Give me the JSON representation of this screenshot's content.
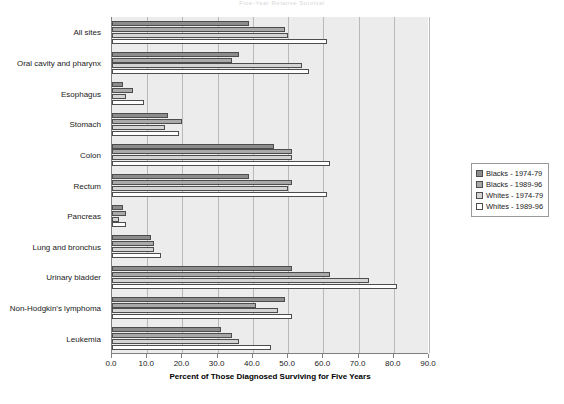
{
  "figure": {
    "title": "Five-Year Relative Survival"
  },
  "chart_data": {
    "type": "bar",
    "orientation": "horizontal",
    "title": "Five-Year Relative Survival",
    "xlabel": "Percent of Those Diagnosed Surviving for Five Years",
    "ylabel": "",
    "xlim": [
      0.0,
      90.0
    ],
    "xticks": [
      0.0,
      10.0,
      20.0,
      30.0,
      40.0,
      50.0,
      60.0,
      70.0,
      80.0,
      90.0
    ],
    "xtick_labels": [
      "0.0",
      "10.0",
      "20.0",
      "30.0",
      "40.0",
      "50.0",
      "60.0",
      "70.0",
      "80.0",
      "90.0"
    ],
    "grid": true,
    "legend_position": "right",
    "categories": [
      "All sites",
      "Oral cavity and pharynx",
      "Esophagus",
      "Stomach",
      "Colon",
      "Rectum",
      "Pancreas",
      "Lung and bronchus",
      "Urinary bladder",
      "Non-Hodgkin's lymphoma",
      "Leukemia"
    ],
    "series": [
      {
        "name": "Blacks - 1974-79",
        "color": "#8c8c8c",
        "values": [
          39.0,
          36.0,
          3.0,
          16.0,
          46.0,
          39.0,
          3.0,
          11.0,
          51.0,
          49.0,
          31.0
        ]
      },
      {
        "name": "Blacks - 1989-96",
        "color": "#a9a9a9",
        "values": [
          49.0,
          34.0,
          6.0,
          20.0,
          51.0,
          51.0,
          4.0,
          12.0,
          62.0,
          41.0,
          34.0
        ]
      },
      {
        "name": "Whites - 1974-79",
        "color": "#d4d4d4",
        "values": [
          50.0,
          54.0,
          4.0,
          15.0,
          51.0,
          50.0,
          2.0,
          12.0,
          73.0,
          47.0,
          36.0
        ]
      },
      {
        "name": "Whites - 1989-96",
        "color": "#ffffff",
        "values": [
          61.0,
          56.0,
          9.0,
          19.0,
          62.0,
          61.0,
          4.0,
          14.0,
          81.0,
          51.0,
          45.0
        ]
      }
    ]
  },
  "legend": {
    "entries": [
      {
        "label": "Blacks - 1974-79"
      },
      {
        "label": "Blacks - 1989-96"
      },
      {
        "label": "Whites - 1974-79"
      },
      {
        "label": "Whites - 1989-96"
      }
    ]
  }
}
